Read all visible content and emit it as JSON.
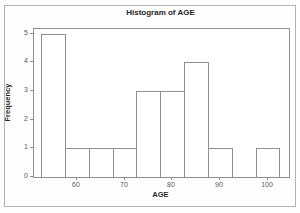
{
  "chart_data": {
    "type": "bar",
    "subtype": "histogram",
    "title": "Histogram of AGE",
    "xlabel": "AGE",
    "ylabel": "Frequency",
    "bin_edges": [
      52.5,
      57.5,
      62.5,
      67.5,
      72.5,
      77.5,
      82.5,
      87.5,
      92.5,
      97.5,
      102.5
    ],
    "bin_midpoints": [
      55,
      60,
      65,
      70,
      75,
      80,
      85,
      90,
      95,
      100
    ],
    "frequencies": [
      5,
      1,
      1,
      1,
      3,
      3,
      4,
      1,
      0,
      1
    ],
    "x_ticks": [
      60,
      70,
      80,
      90,
      100
    ],
    "y_ticks": [
      0,
      1,
      2,
      3,
      4,
      5
    ],
    "xlim": [
      51,
      104.5
    ],
    "ylim": [
      0,
      5.17
    ],
    "grid": false,
    "legend": "none",
    "bar_fill": "#ffffff",
    "bar_border": "#8f8f8f",
    "frame_color": "#8f8f8f",
    "text_color": "#262626",
    "tick_text_color": "#595959",
    "outer_border_color": "#b3b3b3"
  }
}
